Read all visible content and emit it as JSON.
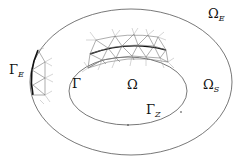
{
  "diagram": {
    "labels": {
      "omega_e": {
        "main": "Ω",
        "sub": "E"
      },
      "gamma_e": {
        "main": "Γ",
        "sub": "E"
      },
      "gamma": {
        "main": "Γ",
        "sub": ""
      },
      "omega": {
        "main": "Ω",
        "sub": ""
      },
      "omega_s": {
        "main": "Ω",
        "sub": "S"
      },
      "gamma_z": {
        "main": "Γ",
        "sub": "Z"
      }
    },
    "colors": {
      "stroke": "#555555",
      "bold_stroke": "#111111",
      "mesh": "#777777",
      "mesh_faint": "#aaaaaa"
    }
  }
}
